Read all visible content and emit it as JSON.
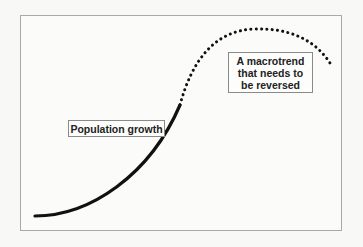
{
  "diagram": {
    "labels": {
      "population_growth": "Population growth",
      "macrotrend_line1": "A macrotrend",
      "macrotrend_line2": "that needs to",
      "macrotrend_line3": "be reversed"
    },
    "curve": {
      "solid_segment": "observed population growth (exponential rise)",
      "dotted_segment": "projected continuation peaking then declining"
    },
    "colors": {
      "line": "#111111",
      "frame": "#a9a9a9",
      "background": "#f8f8f6"
    }
  }
}
